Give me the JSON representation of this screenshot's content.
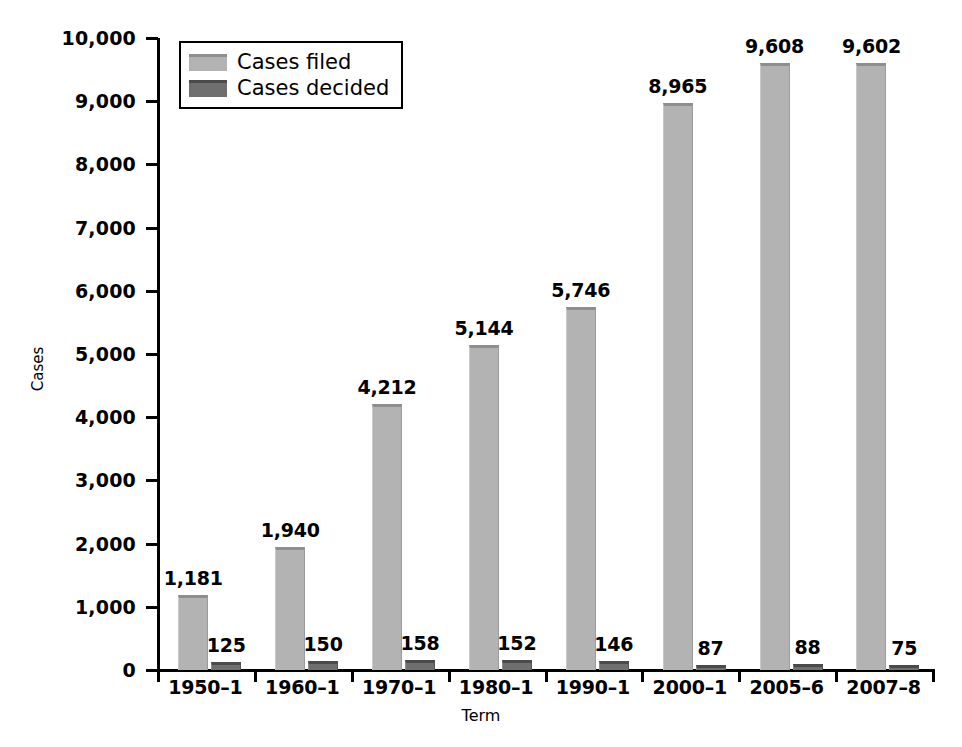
{
  "chart_data": {
    "type": "bar",
    "title": "",
    "xlabel": "Term",
    "ylabel": "Cases",
    "categories": [
      "1950–1",
      "1960–1",
      "1970–1",
      "1980–1",
      "1990–1",
      "2000–1",
      "2005–6",
      "2007–8"
    ],
    "series": [
      {
        "name": "Cases filed",
        "color": "#b3b3b3",
        "values": [
          1181,
          1940,
          4212,
          5144,
          5746,
          8965,
          9608,
          9602
        ],
        "labels": [
          "1,181",
          "1,940",
          "4,212",
          "5,144",
          "5,746",
          "8,965",
          "9,608",
          "9,602"
        ]
      },
      {
        "name": "Cases decided",
        "color": "#6f6f6f",
        "values": [
          125,
          150,
          158,
          152,
          146,
          87,
          88,
          75
        ],
        "labels": [
          "125",
          "150",
          "158",
          "152",
          "146",
          "87",
          "88",
          "75"
        ]
      }
    ],
    "ylim": [
      0,
      10000
    ],
    "ytick_values": [
      0,
      1000,
      2000,
      3000,
      4000,
      5000,
      6000,
      7000,
      8000,
      9000,
      10000
    ],
    "ytick_labels": [
      "0",
      "1,000",
      "2,000",
      "3,000",
      "4,000",
      "5,000",
      "6,000",
      "7,000",
      "8,000",
      "9,000",
      "10,000"
    ],
    "grid": false,
    "legend_position": "top-left-inside",
    "legend_entries": [
      "Cases filed",
      "Cases decided"
    ]
  }
}
